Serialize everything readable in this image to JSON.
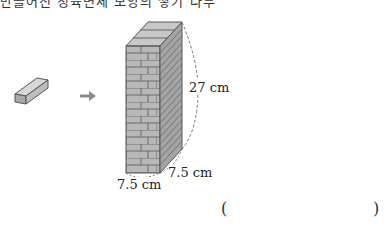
{
  "question": {
    "top_text_clipped": "만들어진 정육면체 모양의 쌓기 나무"
  },
  "figure": {
    "height_label": "27 cm",
    "width_label_front": "7.5 cm",
    "width_label_side": "7.5 cm",
    "arrow": "→"
  },
  "answer": {
    "open_paren": "(",
    "close_paren": ")"
  }
}
